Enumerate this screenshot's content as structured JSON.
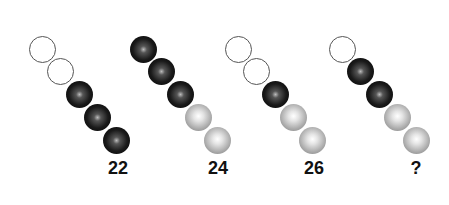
{
  "puzzle": {
    "groups": [
      {
        "label": "22",
        "balls": [
          "empty",
          "empty",
          "black",
          "black",
          "black"
        ],
        "start_x": 42
      },
      {
        "label": "24",
        "balls": [
          "black",
          "black",
          "black",
          "gray",
          "gray"
        ],
        "start_x": 143
      },
      {
        "label": "26",
        "balls": [
          "empty",
          "empty",
          "black",
          "gray",
          "gray"
        ],
        "start_x": 238
      },
      {
        "label": "?",
        "balls": [
          "empty",
          "black",
          "black",
          "gray",
          "gray"
        ],
        "start_x": 342
      }
    ]
  }
}
